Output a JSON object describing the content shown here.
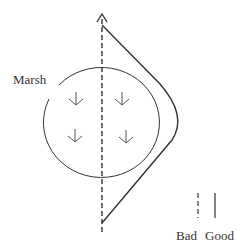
{
  "diagram": {
    "region_label": "Marsh",
    "legend": {
      "bad_label": "Bad",
      "good_label": "Good"
    },
    "colors": {
      "stroke": "#333333",
      "background": "#ffffff"
    }
  }
}
